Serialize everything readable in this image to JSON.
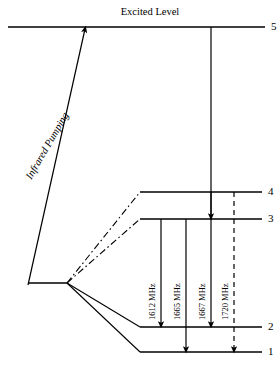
{
  "figure": {
    "type": "energy-level-diagram",
    "title_label": "Excited Level",
    "pumping_label": "Infrared Pumping",
    "background_color": "#ffffff",
    "line_color": "#000000"
  },
  "levels": [
    {
      "id": "level-5",
      "number": "5",
      "name": "excited-level",
      "y": 27,
      "x_start": 8,
      "x_end": 265,
      "style": "solid"
    },
    {
      "id": "level-4",
      "number": "4",
      "name": "hyperfine-level-4",
      "y": 192,
      "x_start": 140,
      "x_end": 262,
      "style": "solid"
    },
    {
      "id": "level-3",
      "number": "3",
      "name": "hyperfine-level-3",
      "y": 219,
      "x_start": 140,
      "x_end": 262,
      "style": "solid"
    },
    {
      "id": "level-2",
      "number": "2",
      "name": "hyperfine-level-2",
      "y": 327,
      "x_start": 140,
      "x_end": 262,
      "style": "solid"
    },
    {
      "id": "level-1",
      "number": "1",
      "name": "hyperfine-level-1",
      "y": 352,
      "x_start": 140,
      "x_end": 262,
      "style": "solid"
    }
  ],
  "ground_state": {
    "name": "ground-state-line",
    "y": 283,
    "x_start": 28,
    "x_end": 67
  },
  "fan": {
    "origin_x": 67,
    "origin_y": 283,
    "branches": [
      {
        "name": "fan-branch-to-level-4",
        "to_x": 140,
        "to_y": 192,
        "style": "dash-dot"
      },
      {
        "name": "fan-branch-to-level-3",
        "to_x": 140,
        "to_y": 219,
        "style": "dash-dot"
      },
      {
        "name": "fan-branch-to-level-2",
        "to_x": 140,
        "to_y": 327,
        "style": "solid"
      },
      {
        "name": "fan-branch-to-level-1",
        "to_x": 140,
        "to_y": 352,
        "style": "solid"
      }
    ]
  },
  "pump_arrow": {
    "name": "infrared-pumping-arrow",
    "from_x": 28,
    "from_y": 285,
    "to_x": 85,
    "to_y": 29,
    "style": "solid",
    "arrowhead": "end"
  },
  "decay_arrow": {
    "name": "excited-to-level-3-arrow",
    "x": 211,
    "from_y": 27,
    "to_y": 217,
    "style": "solid",
    "arrowhead": "end"
  },
  "transitions": [
    {
      "name": "transition-1612",
      "label": "1612 MHz",
      "x": 161,
      "from_y": 219,
      "to_y": 325,
      "from_level": "3",
      "to_level": "2",
      "style": "solid",
      "frequency_mhz": 1612
    },
    {
      "name": "transition-1665",
      "label": "1665 MHz",
      "x": 186,
      "from_y": 219,
      "to_y": 350,
      "from_level": "3",
      "to_level": "1",
      "style": "solid",
      "frequency_mhz": 1665
    },
    {
      "name": "transition-1667",
      "label": "1667 MHz",
      "x": 211,
      "from_y": 192,
      "to_y": 325,
      "from_level": "4",
      "to_level": "2",
      "style": "solid",
      "frequency_mhz": 1667
    },
    {
      "name": "transition-1720",
      "label": "1720 MHz",
      "x": 234,
      "from_y": 192,
      "to_y": 350,
      "from_level": "4",
      "to_level": "1",
      "style": "dashed",
      "frequency_mhz": 1720
    }
  ],
  "label_positions": {
    "excited_label_x": 150,
    "excited_label_y": 6,
    "freq_label_y": 310,
    "pump_label_x": 33,
    "pump_label_y": 170
  }
}
